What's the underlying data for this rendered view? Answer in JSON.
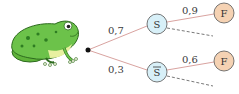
{
  "diagram": {
    "type": "probability-tree",
    "colors": {
      "branch": "#d9a3a0",
      "dashed": "#555555",
      "s_fill": "#d8f0f8",
      "s_stroke": "#555555",
      "f_fill": "#f5d2b3",
      "f_stroke": "#555555",
      "root": "#111111"
    },
    "root": {
      "label": ""
    },
    "level1": [
      {
        "node": "S",
        "prob": "0,7"
      },
      {
        "node": "S̅",
        "prob": "0,3"
      }
    ],
    "level2": [
      {
        "parent": "S",
        "node": "F",
        "prob": "0,9"
      },
      {
        "parent": "S̅",
        "node": "F",
        "prob": "0,6"
      }
    ],
    "illustration": "frog-image"
  }
}
